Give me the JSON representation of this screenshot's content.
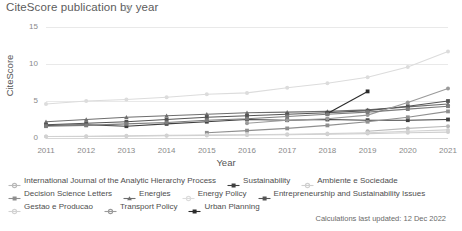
{
  "header": {
    "title": "CiteScore publication by year",
    "info_icon": "info-circle-icon"
  },
  "footer": {
    "note": "Calculations last updated: 12 Dec 2022"
  },
  "chart_data": {
    "type": "line",
    "title": "CiteScore publication by year",
    "xlabel": "Year",
    "ylabel": "CiteScore",
    "x": [
      2011,
      2012,
      2013,
      2014,
      2015,
      2016,
      2017,
      2018,
      2019,
      2020,
      2021
    ],
    "categories": [
      "2011",
      "2012",
      "2013",
      "2014",
      "2015",
      "2016",
      "2017",
      "2018",
      "2019",
      "2020",
      "2021"
    ],
    "ylim": [
      0,
      15
    ],
    "yticks": [
      0,
      5,
      10,
      15
    ],
    "grid": true,
    "legend_position": "bottom",
    "series": [
      {
        "name": "International Journal of the Analytic Hierarchy Process",
        "color": "#b9b9b9",
        "marker": "circle",
        "values": [
          null,
          null,
          null,
          null,
          null,
          null,
          null,
          null,
          0.9,
          1.3,
          1.6
        ]
      },
      {
        "name": "Sustainability",
        "color": "#3f3f3f",
        "marker": "square",
        "values": [
          1.7,
          1.8,
          1.6,
          1.9,
          2.2,
          2.5,
          2.4,
          2.5,
          2.4,
          2.4,
          2.5
        ]
      },
      {
        "name": "Ambiente e Sociedade",
        "color": "#cfcfcf",
        "marker": "circle",
        "values": [
          0.2,
          0.2,
          0.25,
          0.3,
          0.35,
          0.4,
          0.45,
          0.5,
          0.6,
          0.7,
          0.8
        ]
      },
      {
        "name": "Decision Science Letters",
        "color": "#8f8f8f",
        "marker": "square",
        "values": [
          null,
          null,
          null,
          null,
          0.7,
          1.0,
          1.3,
          1.7,
          2.2,
          2.8,
          3.6
        ]
      },
      {
        "name": "Energies",
        "color": "#6e6e6e",
        "marker": "triangle",
        "values": [
          2.2,
          2.5,
          2.8,
          3.0,
          3.2,
          3.4,
          3.5,
          3.6,
          3.8,
          4.2,
          4.6
        ]
      },
      {
        "name": "Energy Policy",
        "color": "#dcdcdc",
        "marker": "circle",
        "values": [
          4.6,
          5.0,
          5.2,
          5.5,
          5.9,
          6.1,
          6.8,
          7.4,
          8.2,
          9.6,
          11.7
        ]
      },
      {
        "name": "Entrepreneurship and Sustainability Issues",
        "color": "#555555",
        "marker": "square",
        "values": [
          1.8,
          2.0,
          2.2,
          2.5,
          2.8,
          3.0,
          3.2,
          3.4,
          3.7,
          4.3,
          5.0
        ]
      },
      {
        "name": "Gestao e Producao",
        "color": "#d2d2d2",
        "marker": "circle",
        "values": [
          0.2,
          0.25,
          0.3,
          0.35,
          0.4,
          0.45,
          0.5,
          0.6,
          0.7,
          0.9,
          1.1
        ]
      },
      {
        "name": "Transport Policy",
        "color": "#9a9a9a",
        "marker": "circle",
        "values": [
          null,
          null,
          null,
          null,
          null,
          2.0,
          2.4,
          2.6,
          3.1,
          4.8,
          6.7
        ]
      },
      {
        "name": "Urban Planning",
        "color": "#2b2b2b",
        "marker": "square",
        "values": [
          null,
          null,
          null,
          null,
          null,
          null,
          null,
          3.3,
          6.3,
          null,
          null
        ]
      },
      {
        "name": "Sustainability (secondary)",
        "color": "#7c7c7c",
        "marker": "square",
        "values": [
          1.6,
          1.7,
          1.9,
          2.1,
          2.4,
          2.6,
          2.9,
          3.2,
          3.5,
          3.9,
          4.3
        ]
      }
    ],
    "legend": [
      [
        {
          "label": "International Journal of the Analytic Hierarchy Process",
          "color": "#b9b9b9",
          "marker": "circle"
        },
        {
          "label": "Sustainability",
          "color": "#3f3f3f",
          "marker": "square"
        },
        {
          "label": "Ambiente e Sociedade",
          "color": "#cfcfcf",
          "marker": "circle"
        }
      ],
      [
        {
          "label": "Decision Science Letters",
          "color": "#8f8f8f",
          "marker": "square"
        },
        {
          "label": "Energies",
          "color": "#6e6e6e",
          "marker": "triangle"
        },
        {
          "label": "Energy Policy",
          "color": "#dcdcdc",
          "marker": "circle"
        },
        {
          "label": "Entrepreneurship and Sustainability Issues",
          "color": "#555555",
          "marker": "square"
        }
      ],
      [
        {
          "label": "Gestao e Producao",
          "color": "#d2d2d2",
          "marker": "circle"
        },
        {
          "label": "Transport Policy",
          "color": "#9a9a9a",
          "marker": "circle"
        },
        {
          "label": "Urban Planning",
          "color": "#2b2b2b",
          "marker": "square"
        }
      ]
    ]
  }
}
